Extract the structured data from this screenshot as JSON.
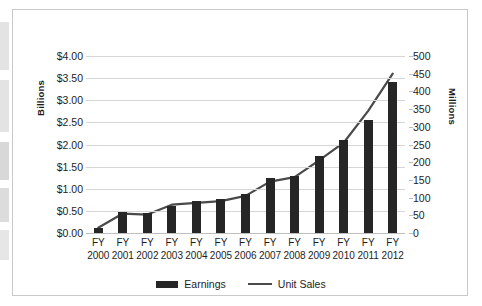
{
  "chart_data": {
    "type": "bar",
    "title": "",
    "subtitle": "",
    "xlabel": "",
    "categories": [
      "FY 2000",
      "FY 2001",
      "FY 2002",
      "FY 2003",
      "FY 2004",
      "FY 2005",
      "FY 2006",
      "FY 2007",
      "FY 2008",
      "FY 2009",
      "FY 2010",
      "FY 2011",
      "FY 2012"
    ],
    "category_lines": [
      [
        "FY",
        "2000"
      ],
      [
        "FY",
        "2001"
      ],
      [
        "FY",
        "2002"
      ],
      [
        "FY",
        "2003"
      ],
      [
        "FY",
        "2004"
      ],
      [
        "FY",
        "2005"
      ],
      [
        "FY",
        "2006"
      ],
      [
        "FY",
        "2007"
      ],
      [
        "FY",
        "2008"
      ],
      [
        "FY",
        "2009"
      ],
      [
        "FY",
        "2010"
      ],
      [
        "FY",
        "2011"
      ],
      [
        "FY",
        "2012"
      ]
    ],
    "series": [
      {
        "name": "Earnings",
        "type": "bar",
        "axis": "left",
        "unit": "Billions",
        "color": "#262626",
        "values": [
          0.12,
          0.47,
          0.45,
          0.6,
          0.72,
          0.78,
          0.88,
          1.25,
          1.28,
          1.73,
          2.11,
          2.55,
          3.42
        ]
      },
      {
        "name": "Unit Sales",
        "type": "line",
        "axis": "right",
        "unit": "Millions",
        "color": "#4a4a4a",
        "values": [
          15,
          55,
          52,
          80,
          85,
          90,
          105,
          145,
          158,
          205,
          255,
          345,
          450
        ]
      }
    ],
    "left_axis": {
      "title": "Billions",
      "ylim": [
        0,
        4
      ],
      "tick_step": 0.5,
      "ticks": [
        0,
        0.5,
        1,
        1.5,
        2,
        2.5,
        3,
        3.5,
        4
      ],
      "tick_labels": [
        "$0.00",
        "$0.50",
        "$1.00",
        "$1.50",
        "$2.00",
        "$2.50",
        "$3.00",
        "$3.50",
        "$4.00"
      ]
    },
    "right_axis": {
      "title": "Millions",
      "ylim": [
        0,
        500
      ],
      "tick_step": 50,
      "ticks": [
        0,
        50,
        100,
        150,
        200,
        250,
        300,
        350,
        400,
        450,
        500
      ],
      "tick_labels": [
        "0",
        "50",
        "100",
        "150",
        "200",
        "250",
        "300",
        "350",
        "400",
        "450",
        "500"
      ]
    },
    "grid": true,
    "legend": {
      "position": "bottom",
      "entries": [
        {
          "label": "Earnings",
          "marker": "bar-swatch"
        },
        {
          "label": "Unit Sales",
          "marker": "line-swatch"
        }
      ]
    }
  }
}
